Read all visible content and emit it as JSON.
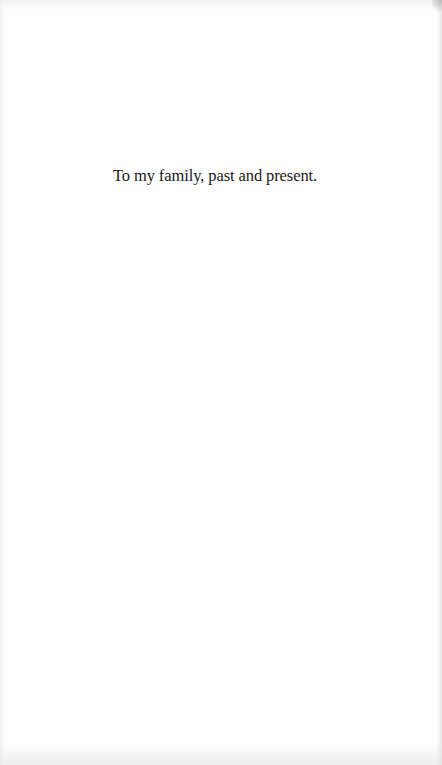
{
  "page": {
    "type": "dedication",
    "text": "To my family, past and present.",
    "background_color": "#fefefe",
    "text_color": "#1a1a1a"
  }
}
